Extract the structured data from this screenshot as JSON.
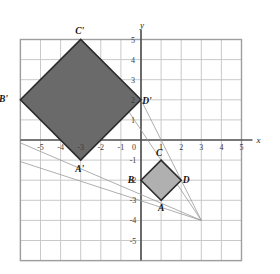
{
  "figure": {
    "type": "coordinate-plane-dilation",
    "axes": {
      "x_name": "x",
      "y_name": "y",
      "x_ticks": [
        "-5",
        "-4",
        "-3",
        "-2",
        "-1",
        "0",
        "1",
        "2",
        "3",
        "4",
        "5"
      ],
      "y_ticks": [
        "5",
        "4",
        "3",
        "2",
        "1",
        "0",
        "-1",
        "-2",
        "-3",
        "-4",
        "-5"
      ],
      "x_range": [
        -6,
        5
      ],
      "y_range": [
        -6,
        5
      ],
      "grid": true
    },
    "colors": {
      "preimage_fill": "#b0b0b0",
      "image_fill": "#6a6a6a",
      "stroke": "#2b2b2b",
      "grid_line": "#c9c9c9",
      "axis_line": "#555555",
      "ray_line": "#9a9a9a"
    },
    "shapes": [
      {
        "name": "preimage-square-ABCD",
        "fill": "#b0b0b0",
        "vertices": [
          {
            "label": "A",
            "x": 1,
            "y": -3,
            "label_dx": 0,
            "label_dy": 11
          },
          {
            "label": "B",
            "x": 0,
            "y": -2,
            "label_dx": -10,
            "label_dy": 3
          },
          {
            "label": "C",
            "x": 1,
            "y": -1,
            "label_dx": -2,
            "label_dy": -4
          },
          {
            "label": "D",
            "x": 2,
            "y": -2,
            "label_dx": 5,
            "label_dy": 3
          }
        ]
      },
      {
        "name": "image-square-A-prime-B-prime-C-prime-D-prime",
        "fill": "#6a6a6a",
        "vertices": [
          {
            "label": "A'",
            "x": -3,
            "y": -1,
            "label_dx": -1,
            "label_dy": 12
          },
          {
            "label": "B'",
            "x": -6,
            "y": 2,
            "label_dx": -17,
            "label_dy": 2
          },
          {
            "label": "C'",
            "x": -3,
            "y": 5,
            "label_dx": -1,
            "label_dy": -6
          },
          {
            "label": "D'",
            "x": 0,
            "y": 2,
            "label_dx": 6,
            "label_dy": 4
          }
        ]
      }
    ],
    "center_of_dilation": {
      "x": 3,
      "y": -4
    },
    "rays": [
      {
        "name": "ray-through-A",
        "to_x": -7.5,
        "to_y": 0.5
      },
      {
        "name": "ray-through-B",
        "to_x": -7.0,
        "to_y": -0.75
      },
      {
        "name": "ray-through-C",
        "to_x": -3,
        "to_y": 5
      },
      {
        "name": "ray-through-D",
        "to_x": 0,
        "to_y": 2
      }
    ]
  }
}
